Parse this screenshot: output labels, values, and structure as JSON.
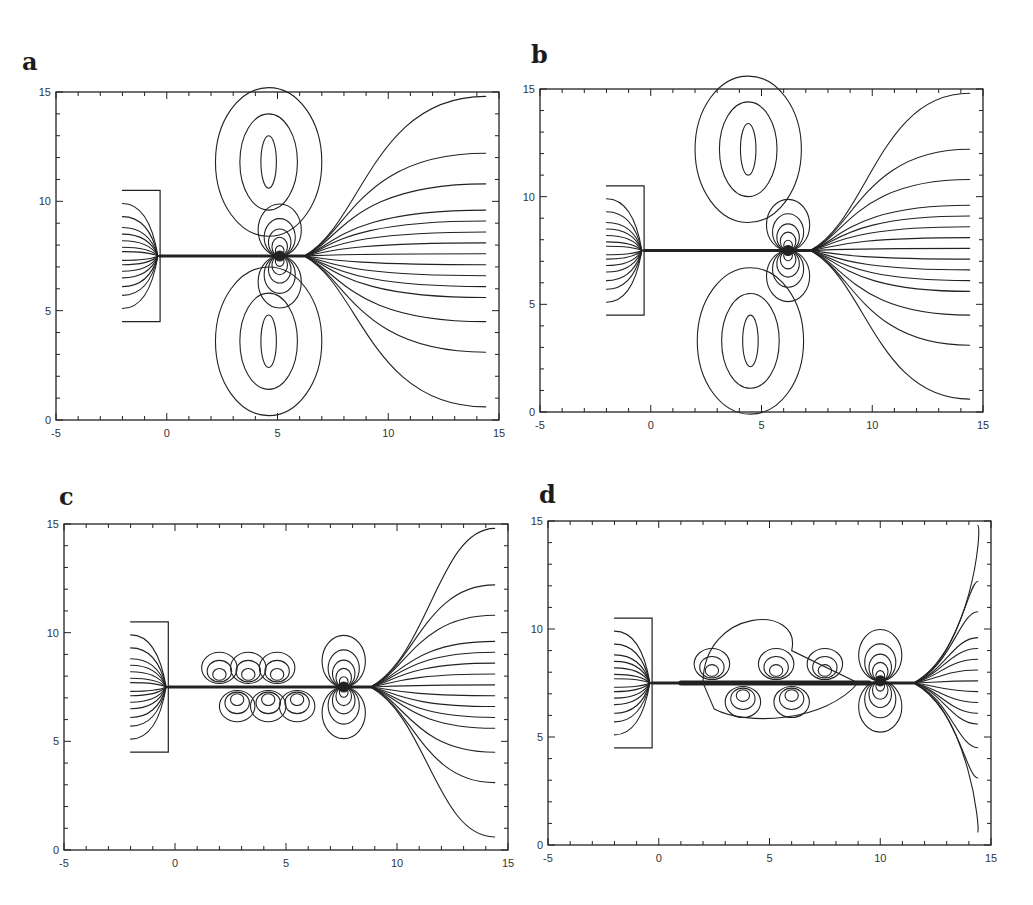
{
  "figure": {
    "panels": [
      {
        "label": "a"
      },
      {
        "label": "b"
      },
      {
        "label": "c"
      },
      {
        "label": "d"
      }
    ]
  },
  "chart_data": [
    {
      "type": "contour",
      "panel": "a",
      "title": "",
      "xlabel": "",
      "ylabel": "",
      "xlim": [
        -5,
        15
      ],
      "ylim": [
        0,
        15
      ],
      "xticks": [
        "-5",
        "0",
        "5",
        "10",
        "15"
      ],
      "yticks": [
        "0",
        "5",
        "10",
        "15"
      ],
      "grid": false,
      "nozzle_box": {
        "x": [
          -2,
          -0.3
        ],
        "y": [
          4.5,
          10.5
        ]
      },
      "jet_axis_y": 7.5,
      "jet_from_x": -0.3,
      "dipole_centers": [
        [
          5.1,
          7.5
        ]
      ],
      "closed_vortex_cells": [
        {
          "center": [
            4.6,
            11.8
          ]
        },
        {
          "center": [
            4.6,
            3.6
          ]
        }
      ],
      "fan_origin_x": 6.2,
      "right_edge_line_ends_y": [
        14.8,
        12.2,
        10.8,
        9.6,
        9.1,
        8.6,
        8.1,
        7.6,
        7.1,
        6.6,
        6.1,
        5.6,
        4.5,
        3.1,
        0.6
      ]
    },
    {
      "type": "contour",
      "panel": "b",
      "title": "",
      "xlabel": "",
      "ylabel": "",
      "xlim": [
        -5,
        15
      ],
      "ylim": [
        0,
        15
      ],
      "xticks": [
        "-5",
        "0",
        "5",
        "10",
        "15"
      ],
      "yticks": [
        "0",
        "5",
        "10",
        "15"
      ],
      "grid": false,
      "nozzle_box": {
        "x": [
          -2,
          -0.3
        ],
        "y": [
          4.5,
          10.5
        ]
      },
      "jet_axis_y": 7.5,
      "jet_from_x": -0.3,
      "dipole_centers": [
        [
          6.2,
          7.5
        ]
      ],
      "closed_vortex_cells": [
        {
          "center": [
            4.4,
            12.2
          ]
        },
        {
          "center": [
            4.5,
            3.3
          ]
        }
      ],
      "fan_origin_x": 7.2,
      "right_edge_line_ends_y": [
        14.8,
        12.2,
        10.8,
        9.6,
        9.1,
        8.6,
        8.1,
        7.6,
        7.1,
        6.6,
        6.1,
        5.6,
        4.5,
        3.1,
        0.6
      ]
    },
    {
      "type": "contour",
      "panel": "c",
      "title": "",
      "xlabel": "",
      "ylabel": "",
      "xlim": [
        -5,
        15
      ],
      "ylim": [
        0,
        15
      ],
      "xticks": [
        "-5",
        "0",
        "5",
        "10",
        "15"
      ],
      "yticks": [
        "0",
        "5",
        "10",
        "15"
      ],
      "grid": false,
      "nozzle_box": {
        "x": [
          -2,
          -0.3
        ],
        "y": [
          4.5,
          10.5
        ]
      },
      "jet_axis_y": 7.5,
      "jet_from_x": -0.3,
      "dipole_centers": [
        [
          7.6,
          7.5
        ]
      ],
      "small_eddies_x": [
        2.0,
        2.8,
        3.3,
        4.2,
        4.6,
        5.5
      ],
      "fan_origin_x": 8.8,
      "right_edge_line_ends_y": [
        14.8,
        12.2,
        10.8,
        9.6,
        9.1,
        8.6,
        8.1,
        7.6,
        7.1,
        6.6,
        6.1,
        5.6,
        4.5,
        3.1,
        0.6
      ]
    },
    {
      "type": "contour",
      "panel": "d",
      "title": "",
      "xlabel": "",
      "ylabel": "",
      "xlim": [
        -5,
        15
      ],
      "ylim": [
        0,
        15
      ],
      "xticks": [
        "-5",
        "0",
        "5",
        "10",
        "15"
      ],
      "yticks": [
        "0",
        "5",
        "10",
        "15"
      ],
      "grid": false,
      "nozzle_box": {
        "x": [
          -2,
          -0.3
        ],
        "y": [
          4.5,
          10.5
        ]
      },
      "jet_axis_y": 7.5,
      "jet_from_x": -0.3,
      "dipole_centers": [
        [
          10.0,
          7.6
        ]
      ],
      "small_eddies_x": [
        2.4,
        3.8,
        5.3,
        6.0,
        7.5
      ],
      "turbulent_region_x": [
        1.0,
        9.5
      ],
      "fan_origin_x": 11.5,
      "right_edge_line_ends_y": [
        14.8,
        12.2,
        10.8,
        9.6,
        9.1,
        8.6,
        8.1,
        7.6,
        7.1,
        6.6,
        6.1,
        5.6,
        4.5,
        3.1,
        0.6
      ]
    }
  ]
}
